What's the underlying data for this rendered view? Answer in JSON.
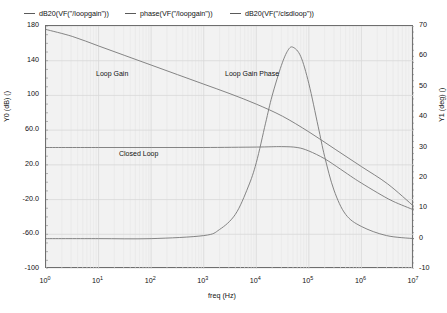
{
  "chart_data": {
    "type": "line",
    "title": "",
    "xlabel": "freq (Hz)",
    "ylabel": "Y0 (dB) ()",
    "y2label": "Y1 (deg) ()",
    "xscale": "log",
    "xlim": [
      1,
      10000000
    ],
    "ylim": [
      -100,
      180
    ],
    "y2lim": [
      -10,
      70
    ],
    "grid": true,
    "legend_position": "top",
    "xticks": [
      "10^0",
      "10^1",
      "10^2",
      "10^3",
      "10^4",
      "10^5",
      "10^6",
      "10^7"
    ],
    "yticks": [
      180,
      140,
      100,
      60.0,
      20.0,
      -20.0,
      -60.0,
      -100
    ],
    "y2ticks": [
      70,
      60,
      50,
      40,
      30,
      20,
      10,
      0,
      -10
    ],
    "series": [
      {
        "name": "dB20(VF(\"/loopgain\"))",
        "axis": "left",
        "color": "#777777",
        "x": [
          1,
          3.16,
          10,
          31.6,
          100,
          316,
          1000,
          3160,
          10000,
          31600,
          100000,
          316000,
          1000000,
          3160000,
          10000000
        ],
        "values": [
          176,
          168,
          157,
          146,
          135,
          124,
          113,
          102,
          90,
          76,
          58,
          38,
          18,
          -2,
          -28
        ]
      },
      {
        "name": "phase(VF(\"/loopgain\"))",
        "axis": "right",
        "color": "#777777",
        "x": [
          1,
          10,
          100,
          1000,
          2000,
          4000,
          7000,
          10000,
          15000,
          20000,
          30000,
          40000,
          50000,
          70000,
          100000,
          150000,
          200000,
          300000,
          500000,
          1000000,
          3000000,
          10000000
        ],
        "values": [
          0,
          0,
          0,
          1,
          3,
          8,
          17,
          25,
          38,
          47,
          57,
          62,
          63,
          60,
          51,
          37,
          27,
          16,
          8,
          4,
          1,
          0
        ]
      },
      {
        "name": "dB20(VF(\"/clsdloop\"))",
        "axis": "left",
        "color": "#777777",
        "x": [
          1,
          10,
          100,
          1000,
          10000,
          30000,
          60000,
          100000,
          200000,
          400000,
          700000,
          1000000,
          2000000,
          4000000,
          10000000
        ],
        "values": [
          40,
          40,
          40,
          40,
          40.5,
          41,
          40,
          36,
          27,
          15,
          5,
          -1,
          -12,
          -22,
          -32
        ]
      }
    ],
    "annotations": [
      {
        "text": "Loop Gain",
        "x_px": 96,
        "y_px": 70
      },
      {
        "text": "Loop Gain Phase",
        "x_px": 225,
        "y_px": 70
      },
      {
        "text": "Closed Loop",
        "x_px": 119,
        "y_px": 150
      }
    ]
  },
  "legend": {
    "items": [
      {
        "label": "dB20(VF(\"/loopgain\"))"
      },
      {
        "label": "phase(VF(\"/loopgain\"))"
      },
      {
        "label": "dB20(VF(\"/clsdloop\"))"
      }
    ]
  },
  "axes": {
    "x_title": "freq (Hz)",
    "y0_title": "Y0 (dB) ()",
    "y1_title": "Y1 (deg) ()",
    "x_ticks": [
      {
        "mantissa": "10",
        "exponent": "0"
      },
      {
        "mantissa": "10",
        "exponent": "1"
      },
      {
        "mantissa": "10",
        "exponent": "2"
      },
      {
        "mantissa": "10",
        "exponent": "3"
      },
      {
        "mantissa": "10",
        "exponent": "4"
      },
      {
        "mantissa": "10",
        "exponent": "5"
      },
      {
        "mantissa": "10",
        "exponent": "6"
      },
      {
        "mantissa": "10",
        "exponent": "7"
      }
    ],
    "y0_ticks": [
      "180",
      "140",
      "100",
      "60.0",
      "20.0",
      "-20.0",
      "-60.0",
      "-100"
    ],
    "y1_ticks": [
      "70",
      "60",
      "50",
      "40",
      "30",
      "20",
      "10",
      "0",
      "-10"
    ]
  },
  "annotations": {
    "loop_gain": "Loop Gain",
    "loop_gain_phase": "Loop Gain Phase",
    "closed_loop": "Closed Loop"
  },
  "colors": {
    "trace": "#777777",
    "grid_major": "#d8d8d8",
    "grid_minor": "#e6e6e6",
    "frame": "#6e6e6e",
    "plot_bg": "#f2f2f2",
    "page_bg": "#ffffff"
  }
}
